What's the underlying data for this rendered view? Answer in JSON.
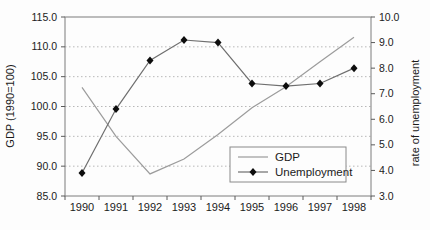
{
  "chart_data": {
    "type": "line",
    "title": "",
    "xlabel": "",
    "ylabel_left": "GDP (1990=100)",
    "ylabel_right": "rate of unemployment",
    "x": [
      1990,
      1991,
      1992,
      1993,
      1994,
      1995,
      1996,
      1997,
      1998
    ],
    "xticks": [
      "1990",
      "1991",
      "1992",
      "1993",
      "1994",
      "1995",
      "1996",
      "1997",
      "1998"
    ],
    "ylim_left": [
      85,
      115
    ],
    "yticks_left": [
      "85.0",
      "90.0",
      "95.0",
      "100.0",
      "105.0",
      "110.0",
      "115.0"
    ],
    "ylim_right": [
      3,
      10
    ],
    "yticks_right": [
      "3.0",
      "4.0",
      "5.0",
      "6.0",
      "7.0",
      "8.0",
      "9.0",
      "10.0"
    ],
    "grid": "horizontal-dotted",
    "legend_position": "inside-bottom-center",
    "series": [
      {
        "name": "GDP",
        "axis": "left",
        "marker": "none",
        "color": "#9c9c9c",
        "values": [
          103.2,
          95.0,
          88.7,
          91.2,
          95.3,
          99.8,
          103.3,
          107.5,
          111.6
        ]
      },
      {
        "name": "Unemployment",
        "axis": "right",
        "marker": "diamond",
        "color": "#6f6f6f",
        "marker_color": "#0d0d0d",
        "values": [
          3.9,
          6.4,
          8.3,
          9.1,
          9.0,
          7.4,
          7.3,
          7.4,
          8.0
        ]
      }
    ],
    "colors": {
      "plot_border": "#7d7d7d",
      "gridline": "#b8b8b8",
      "tick": "#5a5a5a",
      "text": "#1b1b1b",
      "legend_border": "#8a8a8a",
      "background": "#fdfdfd"
    }
  }
}
